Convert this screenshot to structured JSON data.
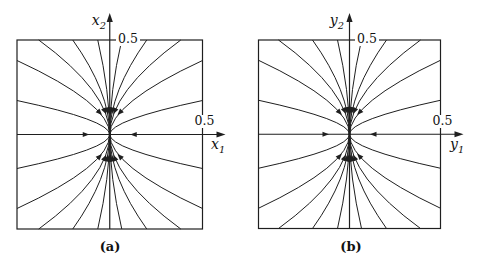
{
  "figure": {
    "background": "#ffffff",
    "line_color": "#1f1f1f",
    "text_color": "#111111",
    "panels": [
      {
        "caption": "(a)",
        "h_axis_label": {
          "base": "x",
          "sub": "1"
        },
        "v_axis_label": {
          "base": "x",
          "sub": "2"
        },
        "h_tick_label": "0.5",
        "v_tick_label": "0.5"
      },
      {
        "caption": "(b)",
        "h_axis_label": {
          "base": "y",
          "sub": "1"
        },
        "v_axis_label": {
          "base": "y",
          "sub": "2"
        },
        "h_tick_label": "0.5",
        "v_tick_label": "0.5"
      }
    ],
    "geometry": {
      "panel_size": {
        "width": 242,
        "height": 267
      },
      "panel_boxes": [
        {
          "left": 17,
          "top": 40,
          "right": 202.5,
          "bottom": 229
        },
        {
          "left": 16.5,
          "top": 40,
          "right": 198.5,
          "bottom": 228.5
        }
      ],
      "axis_tip_overhang": {
        "top": 27,
        "right": 23
      },
      "axis_arrow": {
        "length": 9,
        "half_width": 3.1
      },
      "flow_arrow": {
        "radius": 27,
        "length": 6.5,
        "half_width": 2.6
      },
      "quadrant_curves": [
        {
          "edge": "tb",
          "offset": 12,
          "k": 0.45,
          "arrow": true
        },
        {
          "edge": "tb",
          "offset": 37,
          "k": 0.45,
          "arrow": true
        },
        {
          "edge": "tb",
          "offset": 71,
          "k": 0.45,
          "arrow": true
        },
        {
          "edge": "side",
          "offset": 74,
          "k": 0.42,
          "arrow": true
        },
        {
          "edge": "side",
          "offset": 34,
          "k": 0.42,
          "arrow": false
        }
      ]
    }
  }
}
